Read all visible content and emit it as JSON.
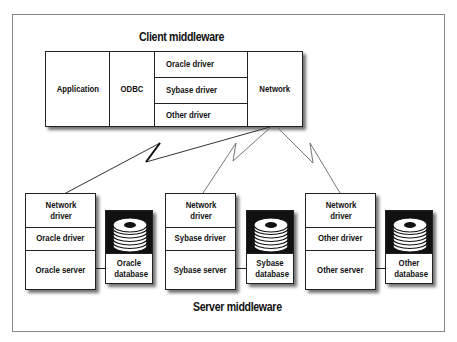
{
  "diagram": {
    "client": {
      "title": "Client middleware",
      "application": "Application",
      "odbc": "ODBC",
      "drivers": [
        "Oracle driver",
        "Sybase driver",
        "Other driver"
      ],
      "network": "Network"
    },
    "servers": [
      {
        "network_driver": "Network driver",
        "driver": "Oracle driver",
        "server": "Oracle server",
        "database": "Oracle database"
      },
      {
        "network_driver": "Network driver",
        "driver": "Sybase driver",
        "server": "Sybase server",
        "database": "Sybase database"
      },
      {
        "network_driver": "Network driver",
        "driver": "Other driver",
        "server": "Other server",
        "database": "Other database"
      }
    ],
    "server_title": "Server middleware",
    "icons": {
      "database": "disk-stack-icon",
      "link": "lightning-link-icon"
    }
  }
}
